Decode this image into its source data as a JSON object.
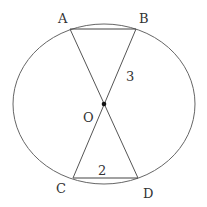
{
  "diagram": {
    "type": "circle-geometry",
    "points": {
      "A": {
        "label": "A",
        "x": 70,
        "y": 29
      },
      "B": {
        "label": "B",
        "x": 136,
        "y": 29
      },
      "C": {
        "label": "C",
        "x": 73,
        "y": 178
      },
      "D": {
        "label": "D",
        "x": 138,
        "y": 178
      },
      "O": {
        "label": "O",
        "x": 104,
        "y": 104
      }
    },
    "segments": [
      "AB",
      "CD",
      "AD",
      "BC"
    ],
    "lengths": {
      "OB": "3",
      "CD": "2"
    },
    "colors": {
      "stroke": "#555555",
      "text": "#333333",
      "point": "#111111"
    }
  }
}
